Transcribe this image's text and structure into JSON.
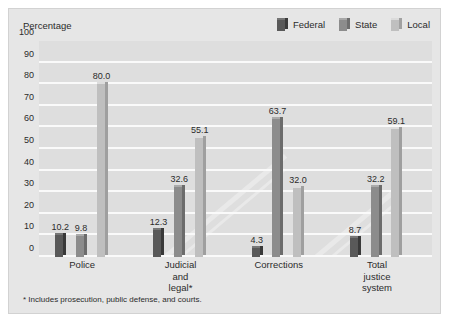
{
  "axis_caption": "Percentage",
  "footnote": "* Includes prosecution, public defense, and courts.",
  "legend": {
    "items": [
      {
        "label": "Federal",
        "icon": "legend-swatch-federal",
        "color": "#595959"
      },
      {
        "label": "State",
        "icon": "legend-swatch-state",
        "color": "#8c8c8c"
      },
      {
        "label": "Local",
        "icon": "legend-swatch-local",
        "color": "#bfbfbf"
      }
    ]
  },
  "colors": {
    "panel_bg": "#e6e6e6",
    "plot_bg": "#dedede",
    "gridline": "#fafafa",
    "federal": "#595959",
    "state": "#8c8c8c",
    "local": "#bfbfbf",
    "text": "#2b2b2b"
  },
  "chart_data": {
    "type": "bar",
    "title": "",
    "subtitle": "",
    "xlabel": "",
    "ylabel": "Percentage",
    "ylim": [
      0,
      100
    ],
    "yticks": [
      0,
      10,
      20,
      30,
      40,
      50,
      60,
      70,
      80,
      90,
      100
    ],
    "ytick_labels": [
      "0",
      "10",
      "20",
      "30",
      "40",
      "50",
      "60",
      "70",
      "80",
      "90",
      "100"
    ],
    "grid": true,
    "legend_position": "top-right",
    "categories": [
      "Police",
      "Judicial\nand\nlegal*",
      "Corrections",
      "Total\njustice\nsystem"
    ],
    "series": [
      {
        "name": "Federal",
        "color": "#595959",
        "values": [
          10.2,
          12.3,
          4.3,
          8.7
        ]
      },
      {
        "name": "State",
        "color": "#8c8c8c",
        "values": [
          9.8,
          32.6,
          63.7,
          32.2
        ]
      },
      {
        "name": "Local",
        "color": "#bfbfbf",
        "values": [
          80.0,
          55.1,
          32.0,
          59.1
        ]
      }
    ],
    "data_labels": [
      [
        "10.2",
        "9.8",
        "80.0"
      ],
      [
        "12.3",
        "32.6",
        "55.1"
      ],
      [
        "4.3",
        "63.7",
        "32.0"
      ],
      [
        "8.7",
        "32.2",
        "59.1"
      ]
    ],
    "annotations": [
      "* Includes prosecution, public defense, and courts."
    ]
  }
}
